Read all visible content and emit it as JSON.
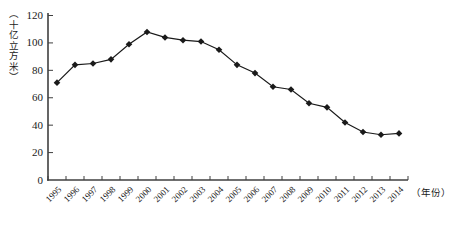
{
  "figure": {
    "background_color": "#ffffff",
    "line_color": "#1a1a1a",
    "marker_color": "#1a1a1a",
    "axis_color": "#3f3f3f",
    "text_color": "#1a1a1a"
  },
  "chart_data": {
    "type": "line",
    "title": "",
    "xlabel": "（年份）",
    "ylabel": "（十亿立方米）",
    "x": [
      1995,
      1996,
      1997,
      1998,
      1999,
      2000,
      2001,
      2002,
      2003,
      2004,
      2005,
      2006,
      2007,
      2008,
      2009,
      2010,
      2011,
      2012,
      2013,
      2014
    ],
    "values": [
      71,
      84,
      85,
      88,
      99,
      108,
      104,
      102,
      101,
      95,
      84,
      78,
      68,
      66,
      56,
      53,
      42,
      35,
      33,
      34
    ],
    "ylim": [
      0,
      120
    ],
    "yticks": [
      0,
      20,
      40,
      60,
      80,
      100,
      120
    ],
    "marker": "diamond",
    "grid": false,
    "legend": "none"
  }
}
